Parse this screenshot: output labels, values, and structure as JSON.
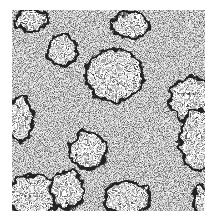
{
  "image": {
    "description": "Grayscale speckled noise texture with white clustered domains outlined in dark pixels",
    "background_color": "#ffffff",
    "noise_light": "#e8e8e8",
    "noise_dark": "#3a3a3a",
    "blob_fill": "#ffffff",
    "blob_edge": "#222222"
  },
  "blobs": [
    {
      "cx": 20,
      "cy": 10,
      "rx": 16,
      "ry": 10
    },
    {
      "cx": 118,
      "cy": 15,
      "rx": 18,
      "ry": 12
    },
    {
      "cx": 50,
      "cy": 40,
      "rx": 14,
      "ry": 15
    },
    {
      "cx": 102,
      "cy": 65,
      "rx": 28,
      "ry": 26
    },
    {
      "cx": 180,
      "cy": 90,
      "rx": 22,
      "ry": 22
    },
    {
      "cx": 186,
      "cy": 130,
      "rx": 18,
      "ry": 30
    },
    {
      "cx": 8,
      "cy": 110,
      "rx": 12,
      "ry": 22
    },
    {
      "cx": 76,
      "cy": 140,
      "rx": 18,
      "ry": 18
    },
    {
      "cx": 22,
      "cy": 185,
      "rx": 26,
      "ry": 20
    },
    {
      "cx": 55,
      "cy": 180,
      "rx": 16,
      "ry": 18
    },
    {
      "cx": 115,
      "cy": 188,
      "rx": 22,
      "ry": 16
    },
    {
      "cx": 190,
      "cy": 190,
      "rx": 8,
      "ry": 14
    }
  ]
}
